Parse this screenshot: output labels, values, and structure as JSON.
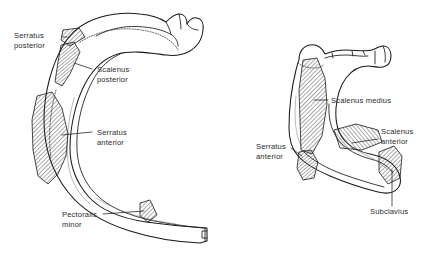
{
  "figure": {
    "background_color": "#ffffff",
    "ink_color": "#1a1a1a",
    "panels": [
      {
        "name": "typical-rib",
        "position": "left",
        "description": "Typical rib, inner surface, showing muscle attachment areas",
        "labels": [
          {
            "id": "serratus-posterior",
            "text_line1": "Serratus",
            "text_line2": "posterior"
          },
          {
            "id": "scalenus-posterior",
            "text_line1": "Scalenus",
            "text_line2": "posterior"
          },
          {
            "id": "serratus-anterior",
            "text_line1": "Serratus",
            "text_line2": "anterior"
          },
          {
            "id": "pectoralis-minor",
            "text_line1": "Pectoralis",
            "text_line2": "minor"
          }
        ]
      },
      {
        "name": "first-rib",
        "position": "right",
        "description": "First rib, superior surface, showing muscle attachment areas",
        "labels": [
          {
            "id": "scalenus-medius",
            "text_line1": "Scalenus medius",
            "text_line2": ""
          },
          {
            "id": "scalenus-anterior",
            "text_line1": "Scalenus",
            "text_line2": "anterior"
          },
          {
            "id": "serratus-anterior",
            "text_line1": "Serratus",
            "text_line2": "anterior"
          },
          {
            "id": "subclavius",
            "text_line1": "Subclavius",
            "text_line2": ""
          }
        ]
      }
    ]
  },
  "labels": {
    "serratus_posterior_1": "Serratus",
    "serratus_posterior_2": "posterior",
    "scalenus_posterior_1": "Scalenus",
    "scalenus_posterior_2": "posterior",
    "serratus_anterior_left_1": "Serratus",
    "serratus_anterior_left_2": "anterior",
    "pectoralis_minor_1": "Pectoralis",
    "pectoralis_minor_2": "minor",
    "scalenus_medius": "Scalenus medius",
    "scalenus_anterior_right_1": "Scalenus",
    "scalenus_anterior_right_2": "anterior",
    "serratus_anterior_right_1": "Serratus",
    "serratus_anterior_right_2": "anterior",
    "subclavius": "Subclavius"
  }
}
